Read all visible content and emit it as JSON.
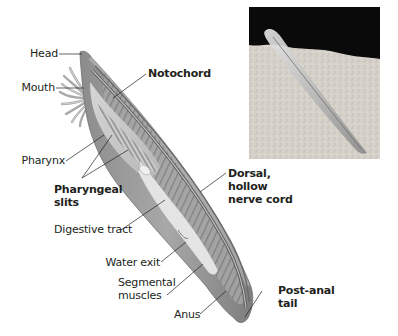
{
  "figure": {
    "labels": {
      "head": "Head",
      "mouth": "Mouth",
      "pharynx": "Pharynx",
      "pharyngeal_slits": "Pharyngeal\nslits",
      "digestive_tract": "Digestive tract",
      "water_exit": "Water exit",
      "segmental_muscles": "Segmental\nmuscles",
      "anus": "Anus",
      "notochord": "Notochord",
      "dorsal_nerve_cord": "Dorsal,\nhollow\nnerve cord",
      "post_anal_tail": "Post-anal\ntail"
    },
    "bold_labels": [
      "notochord",
      "pharyngeal_slits",
      "dorsal_nerve_cord",
      "post_anal_tail"
    ],
    "photo": {
      "description": "Photograph of a lancelet partially buried in sand against a black background"
    },
    "colors": {
      "body_outer": "#9a9a9a",
      "body_inner": "#c4c4c4",
      "gut": "#e2e2e2",
      "leader_line": "#231f20",
      "photo_bg": "#0a0a0a",
      "sand": "#d8d4cc"
    }
  }
}
